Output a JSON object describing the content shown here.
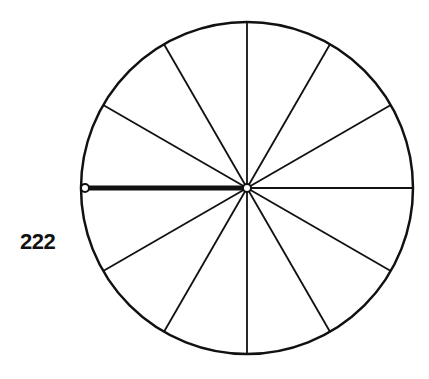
{
  "figure": {
    "label": "222",
    "spoke_count": 12,
    "highlighted_radius_direction": "left",
    "line_color": "#111111",
    "background_color": "#ffffff"
  }
}
